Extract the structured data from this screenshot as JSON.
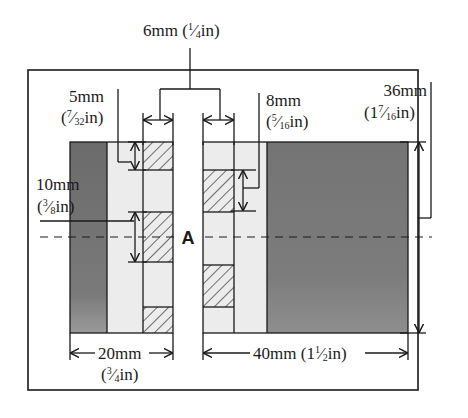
{
  "diagram": {
    "type": "dimensioned cross-section drawing",
    "center_label": "A",
    "colors": {
      "dark_fill": "#707070",
      "light_fill": "#ececec",
      "line": "#1a1a1a",
      "background": "#ffffff"
    },
    "dimensions": {
      "slot_width": {
        "metric": "6mm",
        "imperial_open": "(",
        "imperial_whole": "",
        "imperial_num": "1",
        "imperial_den": "4",
        "imperial_unit": "in)"
      },
      "left_step": {
        "metric": "5mm",
        "imperial_open": "(",
        "imperial_whole": "",
        "imperial_num": "7",
        "imperial_den": "32",
        "imperial_unit": "in)"
      },
      "right_step": {
        "metric": "8mm",
        "imperial_open": "(",
        "imperial_whole": "",
        "imperial_num": "5",
        "imperial_den": "16",
        "imperial_unit": "in)"
      },
      "left_tooth": {
        "metric": "10mm",
        "imperial_open": "(",
        "imperial_whole": "",
        "imperial_num": "3",
        "imperial_den": "8",
        "imperial_unit": "in)"
      },
      "height": {
        "metric": "36mm",
        "imperial_open": "(",
        "imperial_whole": "1",
        "imperial_num": "7",
        "imperial_den": "16",
        "imperial_unit": "in)"
      },
      "left_width": {
        "metric": "20mm",
        "imperial_open": "(",
        "imperial_whole": "",
        "imperial_num": "3",
        "imperial_den": "4",
        "imperial_unit": "in)"
      },
      "right_width": {
        "metric": "40mm",
        "imperial_open": "(",
        "imperial_whole": "1",
        "imperial_num": "1",
        "imperial_den": "2",
        "imperial_unit": "in)"
      }
    },
    "labels": {
      "slot_width_text": "6mm (¼in)",
      "left_step_line1": "5mm",
      "left_step_line2": "(7/32in)",
      "right_step_line1": "8mm",
      "right_step_line2": "(5/16in)",
      "left_tooth_line1": "10mm",
      "left_tooth_line2": "(3/8in)",
      "height_line1": "36mm",
      "height_line2": "(17/16in)",
      "left_width_line1": "20mm",
      "left_width_line2": "(3/4in)",
      "right_width_text": "40mm (1½in)"
    }
  }
}
